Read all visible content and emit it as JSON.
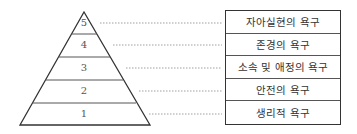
{
  "levels": [
    {
      "number": "5",
      "label": "자아실현의 욕구"
    },
    {
      "number": "4",
      "label": "존경의 욕구"
    },
    {
      "number": "3",
      "label": "소속 및 애정의 욕구"
    },
    {
      "number": "2",
      "label": "안전의 욕구"
    },
    {
      "number": "1",
      "label": "생리적 욕구"
    }
  ]
}
